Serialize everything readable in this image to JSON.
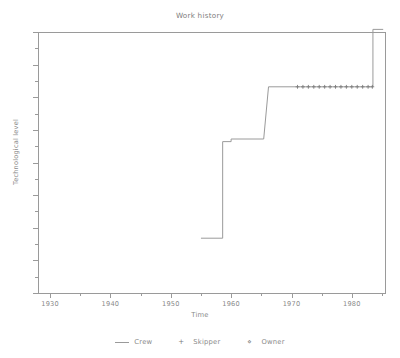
{
  "chart_data": {
    "type": "line",
    "title": "Work history",
    "xlabel": "Time",
    "ylabel": "Technological level",
    "xlim": [
      1928,
      1985.5
    ],
    "ylim": [
      0,
      10
    ],
    "grid": false,
    "legend_position": "bottom",
    "x_ticks_major": [
      1930,
      1940,
      1950,
      1960,
      1970,
      1980
    ],
    "x_tick_labels": [
      "1930",
      "1940",
      "1950",
      "1960",
      "1970",
      "1980"
    ],
    "x_ticks_minor": [
      1935,
      1945,
      1955,
      1965,
      1975,
      1985
    ],
    "y_ticks_count": 17,
    "y_tick_labels": [],
    "series": [
      {
        "name": "Crew",
        "style": "step-line",
        "marker": "none",
        "color": "#9a9a9a",
        "points": [
          {
            "x": 1955.0,
            "y": 2.1
          },
          {
            "x": 1958.6,
            "y": 2.1
          },
          {
            "x": 1958.6,
            "y": 5.8
          },
          {
            "x": 1960.0,
            "y": 5.8
          },
          {
            "x": 1960.0,
            "y": 5.9
          },
          {
            "x": 1965.4,
            "y": 5.9
          },
          {
            "x": 1966.2,
            "y": 7.9
          },
          {
            "x": 1983.5,
            "y": 7.9
          },
          {
            "x": 1983.5,
            "y": 10.1
          },
          {
            "x": 1985.2,
            "y": 10.1
          }
        ]
      },
      {
        "name": "Skipper",
        "style": "markers",
        "marker": "plus",
        "color": "#7a7a7a",
        "points": [
          {
            "x": 1971.0,
            "y": 7.9
          },
          {
            "x": 1971.9,
            "y": 7.9
          },
          {
            "x": 1972.8,
            "y": 7.9
          },
          {
            "x": 1973.7,
            "y": 7.9
          },
          {
            "x": 1974.6,
            "y": 7.9
          },
          {
            "x": 1975.5,
            "y": 7.9
          },
          {
            "x": 1976.4,
            "y": 7.9
          },
          {
            "x": 1977.3,
            "y": 7.9
          },
          {
            "x": 1978.2,
            "y": 7.9
          },
          {
            "x": 1979.1,
            "y": 7.9
          },
          {
            "x": 1980.0,
            "y": 7.9
          },
          {
            "x": 1980.9,
            "y": 7.9
          },
          {
            "x": 1981.8,
            "y": 7.9
          },
          {
            "x": 1982.7,
            "y": 7.9
          },
          {
            "x": 1983.4,
            "y": 7.9
          }
        ]
      },
      {
        "name": "Owner",
        "style": "markers",
        "marker": "diamond",
        "color": "#9a9a9a",
        "points": []
      }
    ]
  },
  "legend": {
    "items": [
      {
        "label": "Crew",
        "marker": "line"
      },
      {
        "label": "Skipper",
        "marker": "+"
      },
      {
        "label": "Owner",
        "marker": "⋄"
      }
    ]
  },
  "colors": {
    "background": "#ffffff",
    "axis": "#9a9a9a",
    "text": "#8a8a8a",
    "series_line": "#9a9a9a",
    "marker": "#7a7a7a"
  }
}
